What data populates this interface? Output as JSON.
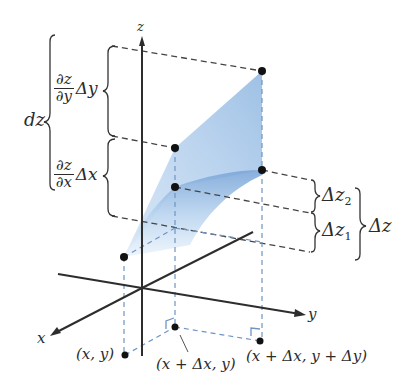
{
  "figure": {
    "colors": {
      "axis": "#2d2d2d",
      "dash_dark": "#444444",
      "dash_blue": "#6f95c4",
      "surface_light": "#cfe1f4",
      "surface_mid": "#a9c8ea",
      "surface_dark": "#7aa6d8",
      "point": "#111111"
    },
    "axes": {
      "z_label": "z",
      "x_label": "x",
      "y_label": "y"
    },
    "left_braces": {
      "outer_label": "dz",
      "upper": {
        "numerator": "∂z",
        "denominator": "∂y",
        "tail": "Δy"
      },
      "lower": {
        "numerator": "∂z",
        "denominator": "∂x",
        "tail": "Δx"
      }
    },
    "right_braces": {
      "upper_label": "Δz",
      "upper_sub": "2",
      "lower_label": "Δz",
      "lower_sub": "1",
      "outer_label": "Δz"
    },
    "points": {
      "p1": "(x, y)",
      "p2": "(x + Δx, y)",
      "p3": "(x + Δx, y + Δy)"
    }
  }
}
